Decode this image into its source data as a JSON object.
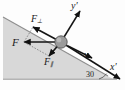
{
  "figure": {
    "type": "physics-force-diagram",
    "background_color": "#fdfdfd",
    "incline": {
      "angle_label": "30",
      "angle_degrees": 30,
      "fill_color": "#d8d8d8",
      "edge_color": "#9a9a9a"
    },
    "body": {
      "shape": "sphere",
      "fill_color": "#9b9b9b",
      "outline_color": "#4a4a4a"
    },
    "labels": {
      "force_total": "F",
      "force_perpendicular_base": "F",
      "force_perpendicular_sub": "⊥",
      "force_parallel_base": "F",
      "force_parallel_sub": "∥",
      "velocity": "v",
      "axis_y_base": "y",
      "axis_y_prime": "′",
      "axis_x_base": "x",
      "axis_x_prime": "′",
      "angle": "30"
    },
    "vectors": [
      {
        "name": "F",
        "label": "F",
        "direction": "horizontal-left",
        "color": "#111111"
      },
      {
        "name": "F-perp",
        "label": "F⊥",
        "direction": "up-left-normal",
        "color": "#111111"
      },
      {
        "name": "F-parallel",
        "label": "F∥",
        "direction": "down-left-tangent",
        "color": "#111111"
      },
      {
        "name": "velocity",
        "label": "v",
        "direction": "down-right-tangent",
        "color": "#111111"
      },
      {
        "name": "axis-y-prime",
        "label": "y′",
        "direction": "up-right-normal",
        "color": "#111111"
      },
      {
        "name": "axis-x-prime",
        "label": "x′",
        "direction": "down-right-slope",
        "color": "#111111"
      }
    ]
  }
}
